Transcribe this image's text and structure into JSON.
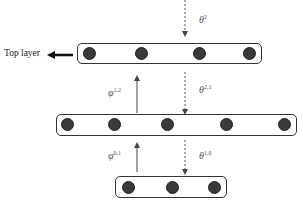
{
  "diagram": {
    "top_layer_label": "Top layer",
    "layers": [
      {
        "name": "top",
        "node_count": 4
      },
      {
        "name": "middle",
        "node_count": 5
      },
      {
        "name": "bottom",
        "node_count": 3
      }
    ],
    "arrows": {
      "theta_2": {
        "symbol": "θ",
        "sup": "2"
      },
      "phi_1_2": {
        "symbol": "φ",
        "sup": "1,2"
      },
      "theta_2_1": {
        "symbol": "θ",
        "sup": "2,1"
      },
      "phi_0_1": {
        "symbol": "φ",
        "sup": "0,1"
      },
      "theta_1_0": {
        "symbol": "θ",
        "sup": "1,0"
      }
    },
    "caption": "Figure ... (faint)"
  }
}
